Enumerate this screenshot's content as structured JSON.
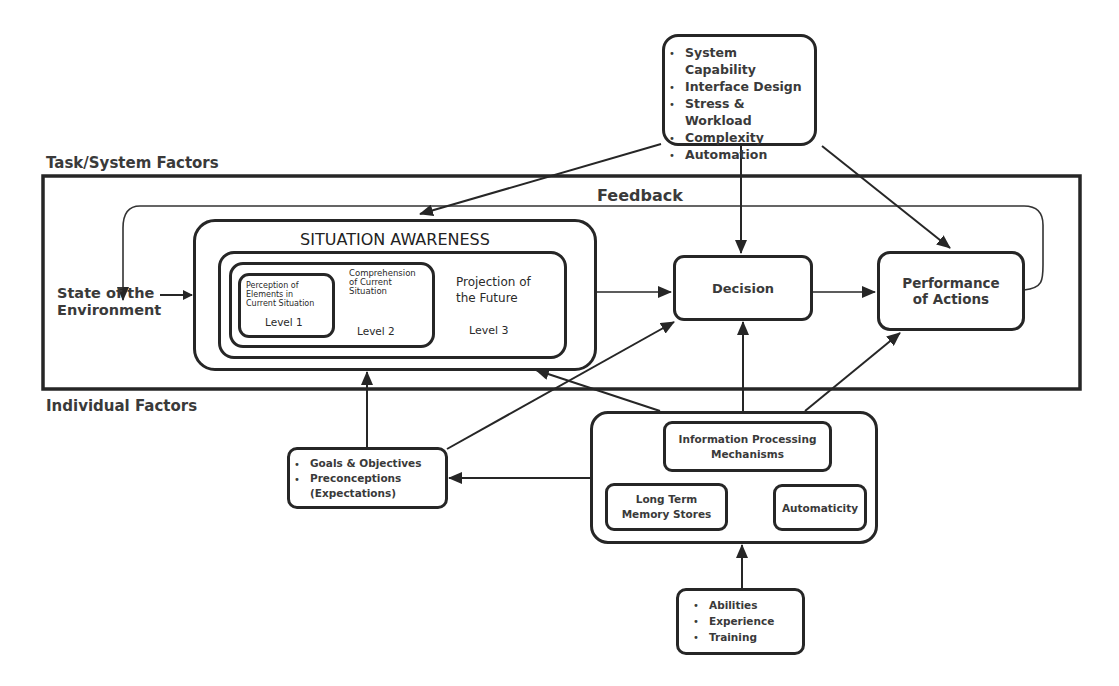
{
  "diagram": {
    "type": "flow-model",
    "sections": {
      "task_system": "Task/System Factors",
      "individual": "Individual Factors"
    },
    "system_factors": {
      "items": [
        "System Capability",
        "Interface Design",
        "Stress & Workload",
        "Complexity",
        "Automation"
      ]
    },
    "feedback": "Feedback",
    "state_env": {
      "line1": "State of the",
      "line2": "Environment"
    },
    "situation_awareness": {
      "title": "SITUATION AWARENESS",
      "level1": {
        "text": [
          "Perception of",
          "Elements in",
          "Current Situation"
        ],
        "label": "Level 1"
      },
      "level2": {
        "text": [
          "Comprehension",
          "of Current",
          "Situation"
        ],
        "label": "Level 2"
      },
      "level3": {
        "text": [
          "Projection of",
          "the Future"
        ],
        "label": "Level 3"
      }
    },
    "decision": "Decision",
    "performance": {
      "line1": "Performance",
      "line2": "of Actions"
    },
    "goals": {
      "items": [
        "Goals & Objectives",
        "Preconceptions"
      ],
      "continuation": "(Expectations)"
    },
    "individual_box": {
      "ipm": {
        "line1": "Information Processing",
        "line2": "Mechanisms"
      },
      "ltm": {
        "line1": "Long Term",
        "line2": "Memory Stores"
      },
      "automaticity": "Automaticity"
    },
    "abilities": {
      "items": [
        "Abilities",
        "Experience",
        "Training"
      ]
    },
    "colors": {
      "stroke": "#262626",
      "text": "#3a3a3a",
      "background": "#ffffff"
    }
  }
}
